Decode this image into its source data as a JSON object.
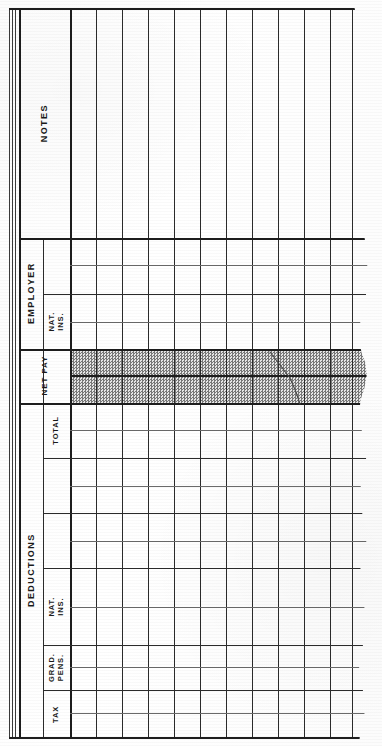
{
  "document": {
    "kind": "payroll-ledger-sheet",
    "orientation": "landscape-rotated",
    "page_background": "#ffffff",
    "ink_color": "#1d1d1d",
    "shade_color": "#cfcfcf"
  },
  "sections": [
    {
      "id": "notes",
      "group_label": "NOTES",
      "has_row_rules": false,
      "sub_columns": []
    },
    {
      "id": "employer",
      "group_label": "EMPLOYER",
      "has_row_rules": true,
      "sub_columns": [
        {
          "label": ""
        },
        {
          "label": "NAT. INS."
        }
      ]
    },
    {
      "id": "net-pay",
      "group_label": "NET PAY",
      "has_row_rules": true,
      "shaded": true,
      "sub_columns": []
    },
    {
      "id": "deductions",
      "group_label": "DEDUCTIONS",
      "has_row_rules": true,
      "sub_columns": [
        {
          "label": "TOTAL"
        },
        {
          "label": ""
        },
        {
          "label": ""
        },
        {
          "label": "NAT. INS."
        },
        {
          "label": "GRAD.\nPENS."
        },
        {
          "label": "TAX"
        }
      ]
    }
  ],
  "grid": {
    "entry_columns": 12,
    "column_header_values": [],
    "row_values": [],
    "cells_filled": 0,
    "note": "blank unfilled ledger form"
  }
}
